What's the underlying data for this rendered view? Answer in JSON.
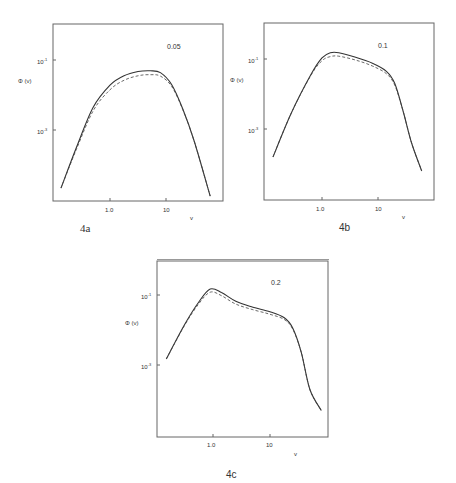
{
  "figures": [
    {
      "id": "4a",
      "caption": "4a",
      "parameter_label": "0.05",
      "ylabel": "Φ (v)",
      "xlabel": "v",
      "xticks": [
        "1.0",
        "10"
      ],
      "yticks": [
        {
          "base": "10",
          "exp": "-1"
        },
        {
          "base": "10",
          "exp": "-3"
        }
      ]
    },
    {
      "id": "4b",
      "caption": "4b",
      "parameter_label": "0.1",
      "ylabel": "Φ (v)",
      "xlabel": "v",
      "xticks": [
        "1.0",
        "10"
      ],
      "yticks": [
        {
          "base": "10",
          "exp": "-1"
        },
        {
          "base": "10",
          "exp": "-3"
        }
      ]
    },
    {
      "id": "4c",
      "caption": "4c",
      "parameter_label": "0.2",
      "ylabel": "Φ (v)",
      "xlabel": "v",
      "xticks": [
        "1.0",
        "10"
      ],
      "yticks": [
        {
          "base": "10",
          "exp": "-1"
        },
        {
          "base": "10",
          "exp": "-3"
        }
      ]
    }
  ],
  "chart_data": [
    {
      "type": "line",
      "title": "4a",
      "annotation": "0.05",
      "xlabel": "v",
      "ylabel": "Φ (v)",
      "xscale": "log",
      "yscale": "log",
      "xtick_labels": [
        "1.0",
        "10"
      ],
      "ytick_labels": [
        "10^-1",
        "10^-3"
      ],
      "grid": false,
      "log10_x_range": [
        -0.95,
        2.05
      ],
      "log10_y_range": [
        -5.0,
        0.0
      ],
      "series": [
        {
          "name": "solid",
          "style": "solid",
          "log10_x": [
            -0.875,
            -0.6,
            -0.3,
            0.0,
            0.25,
            0.5,
            0.72,
            0.9,
            1.1,
            1.3,
            1.5,
            1.79
          ],
          "log10_y": [
            -4.66,
            -3.5,
            -2.35,
            -1.72,
            -1.45,
            -1.33,
            -1.31,
            -1.36,
            -1.7,
            -2.4,
            -3.3,
            -4.89
          ]
        },
        {
          "name": "dashed",
          "style": "dashed",
          "log10_x": [
            -0.875,
            -0.6,
            -0.3,
            0.0,
            0.25,
            0.5,
            0.72,
            0.9,
            1.1,
            1.3,
            1.5,
            1.79
          ],
          "log10_y": [
            -4.66,
            -3.55,
            -2.45,
            -1.85,
            -1.58,
            -1.45,
            -1.42,
            -1.46,
            -1.75,
            -2.42,
            -3.3,
            -4.89
          ]
        }
      ]
    },
    {
      "type": "line",
      "title": "4b",
      "annotation": "0.1",
      "xlabel": "v",
      "ylabel": "Φ (v)",
      "xscale": "log",
      "yscale": "log",
      "xtick_labels": [
        "1.0",
        "10"
      ],
      "ytick_labels": [
        "10^-1",
        "10^-3"
      ],
      "grid": false,
      "log10_x_range": [
        -1.05,
        2.0
      ],
      "log10_y_range": [
        -5.0,
        0.0
      ],
      "series": [
        {
          "name": "solid",
          "style": "solid",
          "log10_x": [
            -0.875,
            -0.55,
            -0.2,
            0.0,
            0.15,
            0.3,
            0.6,
            0.9,
            1.15,
            1.3,
            1.45,
            1.6,
            1.78
          ],
          "log10_y": [
            -3.8,
            -2.55,
            -1.45,
            -0.97,
            -0.82,
            -0.82,
            -0.95,
            -1.12,
            -1.35,
            -1.7,
            -2.5,
            -3.4,
            -4.2
          ]
        },
        {
          "name": "dashed",
          "style": "dashed",
          "log10_x": [
            -0.875,
            -0.55,
            -0.2,
            0.0,
            0.15,
            0.3,
            0.6,
            0.9,
            1.15,
            1.3,
            1.45,
            1.6,
            1.78
          ],
          "log10_y": [
            -3.8,
            -2.55,
            -1.47,
            -1.05,
            -0.93,
            -0.92,
            -1.03,
            -1.2,
            -1.42,
            -1.75,
            -2.5,
            -3.4,
            -4.2
          ]
        }
      ]
    },
    {
      "type": "line",
      "title": "4c",
      "annotation": "0.2",
      "xlabel": "v",
      "ylabel": "Φ (v)",
      "xscale": "log",
      "yscale": "log",
      "xtick_labels": [
        "1.0",
        "10"
      ],
      "ytick_labels": [
        "10^-1",
        "10^-3"
      ],
      "grid": false,
      "log10_x_range": [
        -1.0,
        2.0
      ],
      "log10_y_range": [
        -5.0,
        0.0
      ],
      "series": [
        {
          "name": "solid",
          "style": "solid",
          "log10_x": [
            -0.82,
            -0.5,
            -0.25,
            -0.05,
            0.15,
            0.4,
            0.7,
            1.0,
            1.25,
            1.4,
            1.55,
            1.7,
            1.9
          ],
          "log10_y": [
            -2.83,
            -1.85,
            -1.2,
            -0.83,
            -0.93,
            -1.18,
            -1.35,
            -1.48,
            -1.65,
            -1.95,
            -2.65,
            -3.7,
            -4.3
          ]
        },
        {
          "name": "dashed",
          "style": "dashed",
          "log10_x": [
            -0.82,
            -0.5,
            -0.25,
            -0.05,
            0.15,
            0.4,
            0.7,
            1.0,
            1.25,
            1.4,
            1.55,
            1.7,
            1.9
          ],
          "log10_y": [
            -2.83,
            -1.87,
            -1.25,
            -0.92,
            -1.02,
            -1.26,
            -1.42,
            -1.55,
            -1.7,
            -1.98,
            -2.65,
            -3.7,
            -4.3
          ]
        }
      ]
    }
  ]
}
